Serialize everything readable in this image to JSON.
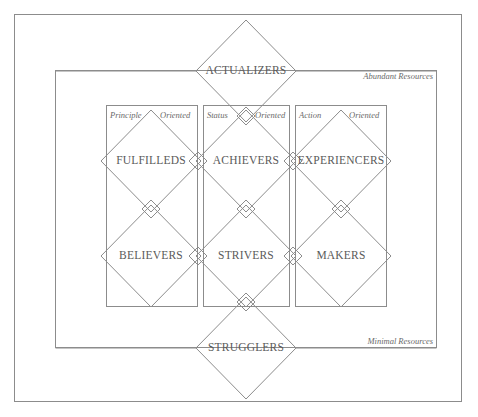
{
  "diagram": {
    "type": "segmentation-framework",
    "colors": {
      "stroke": "#8c8c8c",
      "text": "#5a5a5a",
      "italic_text": "#6a6a6a",
      "background": "#ffffff"
    },
    "resource_labels": {
      "top": "Abundant Resources",
      "bottom": "Minimal Resources"
    },
    "columns": [
      {
        "id": "principle",
        "left_word": "Principle",
        "right_word": "Oriented"
      },
      {
        "id": "status",
        "left_word": "Status",
        "right_word": "Oriented"
      },
      {
        "id": "action",
        "left_word": "Action",
        "right_word": "Oriented"
      }
    ],
    "apex": {
      "label": "ACTUALIZERS"
    },
    "base": {
      "label": "STRUGGLERS"
    },
    "middle_rows": [
      {
        "row": "upper",
        "segments": [
          {
            "label": "FULFILLEDS",
            "column": "principle"
          },
          {
            "label": "ACHIEVERS",
            "column": "status"
          },
          {
            "label": "EXPERIENCERS",
            "column": "action"
          }
        ]
      },
      {
        "row": "lower",
        "segments": [
          {
            "label": "BELIEVERS",
            "column": "principle"
          },
          {
            "label": "STRIVERS",
            "column": "status"
          },
          {
            "label": "MAKERS",
            "column": "action"
          }
        ]
      }
    ],
    "geometry": {
      "outer_frame": {
        "x": 14,
        "y": 14,
        "width": 448,
        "height": 388
      },
      "inner_frame": {
        "x": 55,
        "y": 70,
        "width": 382,
        "height": 278
      },
      "column_rects": [
        {
          "x": 106,
          "y": 105,
          "width": 92,
          "height": 202
        },
        {
          "x": 203,
          "y": 105,
          "width": 87,
          "height": 202
        },
        {
          "x": 295,
          "y": 105,
          "width": 92,
          "height": 202
        }
      ],
      "diamond_half_width": 50,
      "diamond_half_height": 51,
      "small_diamond_half": 9,
      "row_centers_y": [
        71,
        161,
        256,
        348
      ],
      "col_centers_x": [
        151,
        246,
        341
      ]
    }
  }
}
